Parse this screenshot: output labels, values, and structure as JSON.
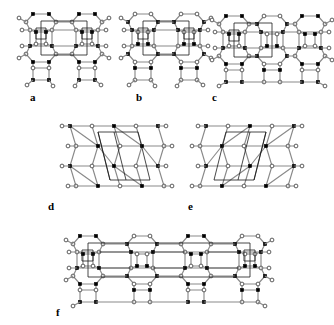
{
  "figure": {
    "width": 334,
    "height": 325,
    "background": "#ffffff",
    "node_styles": {
      "filled_color": "#000000",
      "open_fill": "#ffffff",
      "open_stroke": "#4a4a4a",
      "bond_color": "#8a8a8a",
      "bond_dark_color": "#2b2b2b",
      "unit_cell_color": "#1a1a1a"
    },
    "panels": [
      {
        "id": "a",
        "label": "a",
        "label_x": 30,
        "label_y": 92,
        "x": 18,
        "y": 8,
        "width": 92,
        "height": 78,
        "columns": 2,
        "motif": "eight-ring channels with four-ring pillars, rectangular unit cell"
      },
      {
        "id": "b",
        "label": "b",
        "label_x": 136,
        "label_y": 92,
        "x": 120,
        "y": 8,
        "width": 92,
        "height": 78,
        "columns": 2,
        "motif": "eight-ring channels with four-ring pillars, alternate node colouring"
      },
      {
        "id": "c",
        "label": "c",
        "label_x": 212,
        "label_y": 92,
        "x": 214,
        "y": 8,
        "width": 116,
        "height": 82,
        "columns": 3,
        "motif": "three-column framework, wider periodic repeat"
      },
      {
        "id": "d",
        "label": "d",
        "label_x": 48,
        "label_y": 201,
        "x": 60,
        "y": 118,
        "width": 110,
        "height": 78,
        "columns": 2,
        "motif": "sheared net, five-ring units, parallelogram unit cell"
      },
      {
        "id": "e",
        "label": "e",
        "label_x": 188,
        "label_y": 201,
        "x": 194,
        "y": 118,
        "width": 110,
        "height": 78,
        "columns": 2,
        "motif": "mirror image of panel d, parallelogram unit cell"
      },
      {
        "id": "f",
        "label": "f",
        "label_x": 56,
        "label_y": 307,
        "x": 62,
        "y": 228,
        "width": 218,
        "height": 82,
        "columns": 4,
        "motif": "wide composite framework combining four-ring, five-ring and eight-ring units"
      }
    ]
  }
}
